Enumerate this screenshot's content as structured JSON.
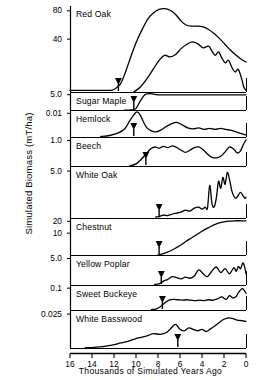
{
  "chart_data": {
    "type": "line",
    "title": "",
    "xlabel": "Thousands of Simulated Years Ago",
    "ylabel": "Simulated Biomass (mT/ha)",
    "xlim": [
      16,
      0
    ],
    "x_ticks": [
      "16",
      "14",
      "12",
      "10",
      "8",
      "6",
      "4",
      "2",
      "0"
    ],
    "x_tick_values": [
      16,
      14,
      12,
      10,
      8,
      6,
      4,
      2,
      0
    ],
    "grid": false,
    "legend": "none",
    "axis_direction": "x decreasing left to right",
    "panels": [
      {
        "label": "Red Oak",
        "y_ticks": [
          "80",
          "40"
        ],
        "y_tick_values": [
          80,
          40
        ],
        "arrival_marker_x": 11.6,
        "series": [
          {
            "name": "upper curve",
            "x": [
              16.0,
              14.0,
              12.6,
              12.0,
              11.4,
              10.9,
              10.4,
              9.9,
              9.4,
              8.9,
              8.4,
              7.9,
              7.4,
              6.9,
              6.4,
              5.9,
              5.4,
              4.9,
              4.4,
              3.9,
              3.4,
              2.9,
              2.4,
              1.9,
              1.4,
              0.9,
              0.4,
              0.0
            ],
            "y": [
              2,
              2,
              2,
              3,
              10,
              26,
              45,
              62,
              76,
              88,
              95,
              99,
              100,
              98,
              93,
              85,
              80,
              79,
              79,
              78,
              75,
              70,
              64,
              57,
              50,
              44,
              39,
              36
            ]
          },
          {
            "name": "lower curve",
            "x": [
              10.2,
              9.6,
              9.0,
              8.4,
              7.9,
              7.4,
              6.9,
              6.4,
              5.9,
              5.4,
              4.9,
              4.4,
              3.9,
              3.4,
              3.1,
              2.8,
              2.5,
              2.2,
              1.9,
              1.6,
              1.3,
              1.0,
              0.7,
              0.4,
              0.2,
              0.0
            ],
            "y": [
              0,
              6,
              16,
              28,
              38,
              44,
              42,
              45,
              52,
              57,
              60,
              58,
              53,
              55,
              49,
              44,
              48,
              41,
              35,
              38,
              30,
              24,
              27,
              16,
              6,
              2
            ]
          }
        ]
      },
      {
        "label": "Sugar Maple",
        "y_ticks": [
          "5.0"
        ],
        "y_tick_values": [
          5.0
        ],
        "arrival_marker_x": 10.2,
        "series": [
          {
            "name": "sugar maple",
            "x": [
              11.0,
              10.4,
              10.0,
              9.6,
              9.2,
              8.8,
              8.4,
              8.0,
              7.0,
              6.0,
              5.0,
              4.0,
              3.0,
              2.0,
              1.0,
              0.0
            ],
            "y": [
              0,
              0,
              10,
              55,
              92,
              100,
              96,
              92,
              92,
              92,
              92,
              92,
              92,
              92,
              92,
              92
            ]
          }
        ]
      },
      {
        "label": "Hemlock",
        "y_ticks": [
          "0.01"
        ],
        "y_tick_values": [
          0.01
        ],
        "arrival_marker_x": 10.2,
        "series": [
          {
            "name": "hemlock",
            "x": [
              13.2,
              12.4,
              11.6,
              11.0,
              10.6,
              10.2,
              9.9,
              9.6,
              9.3,
              9.0,
              8.6,
              8.2,
              7.8,
              7.3,
              6.8,
              6.3,
              5.8,
              5.3,
              4.8,
              4.3,
              3.8,
              3.3,
              2.8,
              2.3,
              1.8,
              1.3,
              0.9,
              0.5,
              0.2,
              0.0
            ],
            "y": [
              2,
              6,
              16,
              34,
              62,
              88,
              100,
              86,
              58,
              36,
              24,
              20,
              26,
              40,
              52,
              58,
              48,
              36,
              32,
              36,
              30,
              34,
              30,
              34,
              30,
              26,
              20,
              14,
              10,
              8
            ]
          }
        ]
      },
      {
        "label": "Beech",
        "y_ticks": [
          "1.0"
        ],
        "y_tick_values": [
          1.0
        ],
        "arrival_marker_x": 9.1,
        "series": [
          {
            "name": "beech",
            "x": [
              10.6,
              10.0,
              9.5,
              9.1,
              8.7,
              8.3,
              7.9,
              7.5,
              7.1,
              6.7,
              6.3,
              5.9,
              5.5,
              5.1,
              4.7,
              4.3,
              3.9,
              3.5,
              3.1,
              2.7,
              2.3,
              1.9,
              1.5,
              1.1,
              0.8,
              0.5,
              0.25,
              0.0
            ],
            "y": [
              0,
              8,
              26,
              44,
              62,
              70,
              66,
              72,
              68,
              74,
              68,
              58,
              50,
              58,
              68,
              70,
              60,
              44,
              32,
              30,
              36,
              52,
              70,
              62,
              48,
              56,
              78,
              96
            ]
          }
        ]
      },
      {
        "label": "White Oak",
        "y_ticks": [
          "5.0"
        ],
        "y_tick_values": [
          5.0
        ],
        "arrival_marker_x": 7.9,
        "series": [
          {
            "name": "white oak",
            "x": [
              8.2,
              7.9,
              7.5,
              7.1,
              6.7,
              6.3,
              5.9,
              5.5,
              5.1,
              4.7,
              4.3,
              4.0,
              3.7,
              3.5,
              3.3,
              3.1,
              2.9,
              2.7,
              2.5,
              2.3,
              2.1,
              1.9,
              1.7,
              1.5,
              1.3,
              1.1,
              0.9,
              0.7,
              0.5,
              0.3,
              0.1,
              0.0
            ],
            "y": [
              2,
              3,
              6,
              5,
              8,
              10,
              12,
              16,
              14,
              20,
              22,
              18,
              22,
              20,
              66,
              30,
              22,
              40,
              74,
              60,
              82,
              68,
              92,
              78,
              56,
              44,
              40,
              46,
              52,
              46,
              40,
              42
            ]
          }
        ]
      },
      {
        "label": "Chestnut",
        "y_ticks": [
          "20",
          "10"
        ],
        "y_tick_values": [
          20,
          10
        ],
        "arrival_marker_x": 7.9,
        "series": [
          {
            "name": "chestnut",
            "x": [
              8.0,
              7.5,
              7.0,
              6.5,
              6.0,
              5.5,
              5.0,
              4.5,
              4.0,
              3.5,
              3.0,
              2.5,
              2.0,
              1.5,
              1.0,
              0.5,
              0.0
            ],
            "y": [
              0,
              4,
              10,
              18,
              27,
              38,
              48,
              58,
              68,
              77,
              85,
              91,
              95,
              97,
              98,
              98,
              98
            ]
          }
        ]
      },
      {
        "label": "Yellow Poplar",
        "y_ticks": [
          "5.0"
        ],
        "y_tick_values": [
          5.0
        ],
        "arrival_marker_x": 7.7,
        "series": [
          {
            "name": "yellow poplar",
            "x": [
              8.3,
              7.9,
              7.5,
              7.1,
              6.7,
              6.3,
              5.9,
              5.5,
              5.1,
              4.7,
              4.3,
              3.9,
              3.5,
              3.1,
              2.7,
              2.3,
              1.9,
              1.5,
              1.1,
              0.9,
              0.7,
              0.5,
              0.3,
              0.15,
              0.0
            ],
            "y": [
              2,
              4,
              14,
              20,
              30,
              26,
              22,
              28,
              24,
              32,
              54,
              40,
              30,
              50,
              64,
              44,
              58,
              40,
              62,
              48,
              66,
              58,
              78,
              68,
              40
            ]
          }
        ]
      },
      {
        "label": "Sweet Buckeye",
        "y_ticks": [
          "0.1"
        ],
        "y_tick_values": [
          0.1
        ],
        "arrival_marker_x": 7.6,
        "series": [
          {
            "name": "sweet buckeye",
            "x": [
              8.6,
              8.2,
              7.8,
              7.4,
              7.0,
              6.6,
              6.2,
              5.8,
              5.4,
              5.0,
              4.6,
              4.2,
              3.8,
              3.4,
              3.0,
              2.6,
              2.2,
              1.8,
              1.5,
              1.2,
              0.9,
              0.7,
              0.5,
              0.3,
              0.1,
              0.0
            ],
            "y": [
              2,
              4,
              14,
              30,
              42,
              46,
              44,
              42,
              44,
              42,
              40,
              42,
              40,
              44,
              42,
              48,
              56,
              46,
              62,
              52,
              58,
              74,
              86,
              92,
              80,
              72
            ]
          }
        ]
      },
      {
        "label": "White Basswood",
        "y_ticks": [
          "0.025"
        ],
        "y_tick_values": [
          0.025
        ],
        "arrival_marker_x": 6.2,
        "series": [
          {
            "name": "white basswood",
            "x": [
              14.6,
              13.8,
              13.0,
              12.2,
              11.4,
              10.6,
              9.8,
              9.0,
              8.4,
              7.8,
              7.2,
              6.8,
              6.4,
              6.0,
              5.6,
              5.2,
              4.8,
              4.4,
              4.0,
              3.6,
              3.2,
              2.8,
              2.4,
              2.0,
              1.6,
              1.2,
              0.8,
              0.4,
              0.0
            ],
            "y": [
              1,
              2,
              4,
              8,
              14,
              20,
              28,
              34,
              40,
              38,
              44,
              56,
              66,
              52,
              48,
              56,
              52,
              48,
              52,
              46,
              54,
              62,
              72,
              80,
              84,
              82,
              78,
              76,
              74
            ]
          }
        ]
      }
    ]
  }
}
